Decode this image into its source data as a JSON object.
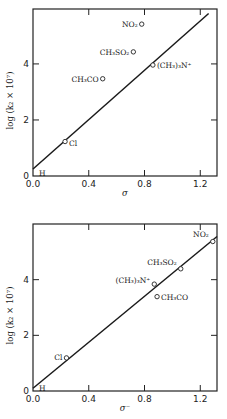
{
  "chart_data": [
    {
      "type": "scatter",
      "title": "",
      "xlabel": "σ",
      "ylabel": "log (k₂ × 10⁷)",
      "xlim": [
        0.0,
        1.32
      ],
      "ylim": [
        0,
        5.96
      ],
      "xticks": [
        0.0,
        0.4,
        0.8,
        1.2
      ],
      "xtick_labels": [
        "0.0",
        "0.4",
        "0.8",
        "1.2"
      ],
      "yticks": [
        0,
        2,
        4
      ],
      "ytick_labels": [
        "0",
        "2",
        "4"
      ],
      "grid": false,
      "legend": null,
      "points": [
        {
          "label": "H",
          "x": 0.0,
          "y": 0.2
        },
        {
          "label": "Cl",
          "x": 0.23,
          "y": 1.23
        },
        {
          "label": "CH₃CO",
          "x": 0.5,
          "y": 3.47
        },
        {
          "label": "CH₃SO₂",
          "x": 0.72,
          "y": 4.43
        },
        {
          "label": "NO₂",
          "x": 0.78,
          "y": 5.42
        },
        {
          "label": "(CH₃)₃N⁺",
          "x": 0.86,
          "y": 3.96
        }
      ],
      "fit_line": {
        "x": [
          0.0,
          1.26
        ],
        "y": [
          0.25,
          5.8
        ]
      }
    },
    {
      "type": "scatter",
      "title": "",
      "xlabel": "σ⁻",
      "ylabel": "log (k₂ × 10⁷)",
      "xlim": [
        0.0,
        1.32
      ],
      "ylim": [
        0,
        6.0
      ],
      "xticks": [
        0.0,
        0.4,
        0.8,
        1.2
      ],
      "xtick_labels": [
        "0.0",
        "0.4",
        "0.8",
        "1.2"
      ],
      "yticks": [
        0,
        2,
        4
      ],
      "ytick_labels": [
        "0",
        "2",
        "4"
      ],
      "grid": false,
      "legend": null,
      "points": [
        {
          "label": "H",
          "x": 0.0,
          "y": 0.2
        },
        {
          "label": "Cl",
          "x": 0.24,
          "y": 1.19
        },
        {
          "label": "(CH₃)₃N⁺",
          "x": 0.87,
          "y": 3.84
        },
        {
          "label": "CH₃CO",
          "x": 0.89,
          "y": 3.39
        },
        {
          "label": "CH₃SO₂",
          "x": 1.06,
          "y": 4.39
        },
        {
          "label": "NO₂",
          "x": 1.29,
          "y": 5.37
        }
      ],
      "fit_line": {
        "x": [
          0.0,
          1.32
        ],
        "y": [
          0.1,
          5.55
        ]
      }
    }
  ],
  "panels": [
    {
      "frame": {
        "left": 33,
        "top": 9,
        "right": 217,
        "bottom": 176
      },
      "xlabel_pos": [
        125,
        196
      ],
      "label_placement": [
        {
          "dx": 6,
          "dy": 6,
          "anchor": "start"
        },
        {
          "dx": 4,
          "dy": 4,
          "anchor": "start"
        },
        {
          "dx": -4,
          "dy": 3,
          "anchor": "end"
        },
        {
          "dx": -4,
          "dy": 3,
          "anchor": "end"
        },
        {
          "dx": -4,
          "dy": 3,
          "anchor": "end"
        },
        {
          "dx": 4,
          "dy": 3,
          "anchor": "start"
        }
      ]
    },
    {
      "frame": {
        "left": 33,
        "top": 224,
        "right": 217,
        "bottom": 391
      },
      "xlabel_pos": [
        125,
        411
      ],
      "label_placement": [
        {
          "dx": 6,
          "dy": 6,
          "anchor": "start"
        },
        {
          "dx": -4,
          "dy": 2,
          "anchor": "end"
        },
        {
          "dx": -4,
          "dy": -1,
          "anchor": "end"
        },
        {
          "dx": 4,
          "dy": 3,
          "anchor": "start"
        },
        {
          "dx": -4,
          "dy": -4,
          "anchor": "end"
        },
        {
          "dx": -4,
          "dy": -5,
          "anchor": "end"
        }
      ]
    }
  ]
}
